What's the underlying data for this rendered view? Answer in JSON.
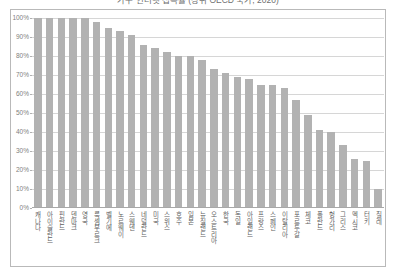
{
  "chart_title": "가구 인터넷 접속률 (상위 OECD 국가, 2020)",
  "chart_data": {
    "type": "bar",
    "title": "가구 인터넷 접속률 (상위 OECD 국가, 2020)",
    "xlabel": "",
    "ylabel": "",
    "ylim": [
      0,
      100
    ],
    "grid": true,
    "legend": "none",
    "unit": "%",
    "y_ticks": [
      "100%",
      "90%",
      "80%",
      "70%",
      "60%",
      "50%",
      "40%",
      "30%",
      "20%",
      "10%",
      "0%"
    ],
    "y_tick_values": [
      100,
      90,
      80,
      70,
      60,
      50,
      40,
      30,
      20,
      10,
      0
    ],
    "bar_color": "#b2b2b2",
    "categories": [
      "캐나다",
      "아이슬란드",
      "핀란드",
      "덴마크",
      "영국",
      "룩셈부르크",
      "벨기에",
      "노르웨이",
      "스웨덴",
      "네덜란드",
      "미국",
      "스위스",
      "호주",
      "일본",
      "뉴질랜드",
      "오스트리아",
      "한국",
      "독일",
      "아일랜드",
      "프랑스",
      "스페인",
      "이탈리아",
      "포르투갈",
      "체코",
      "폴란드",
      "헝가리",
      "그리스",
      "멕시코",
      "터키",
      "칠레"
    ],
    "values": [
      100,
      100,
      100,
      100,
      100,
      98,
      95,
      93,
      91,
      86,
      84,
      82,
      80,
      80,
      78,
      73,
      71,
      69,
      68,
      65,
      65,
      63,
      57,
      49,
      41,
      40,
      33,
      26,
      25,
      10
    ]
  }
}
